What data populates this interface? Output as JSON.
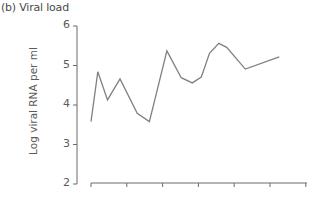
{
  "chart_data": {
    "type": "line",
    "title": "(b) Viral load",
    "xlabel": "",
    "ylabel": "Log viral RNA per ml",
    "ylim": [
      2,
      6
    ],
    "yticks": [
      2,
      3,
      4,
      5,
      6
    ],
    "xticks_count": 7,
    "grid": false,
    "legend": null,
    "series": [
      {
        "name": "Viral load",
        "color": "#808080",
        "x": [
          0,
          0.19,
          0.46,
          0.81,
          1.29,
          1.63,
          2.12,
          2.52,
          2.83,
          3.08,
          3.31,
          3.57,
          3.79,
          4.31,
          5.26
        ],
        "values": [
          3.58,
          4.84,
          4.13,
          4.66,
          3.79,
          3.58,
          5.37,
          4.69,
          4.56,
          4.71,
          5.31,
          5.56,
          5.46,
          4.91,
          5.22
        ]
      }
    ]
  },
  "layout": {
    "plot_left": 91,
    "x_tick_spacing": 35.8,
    "y_px_at_6": 26,
    "y_px_per_unit": 39.5,
    "yaxis_x": 77,
    "xaxis_y": 183,
    "xaxis_start": 91,
    "xaxis_end": 307
  }
}
